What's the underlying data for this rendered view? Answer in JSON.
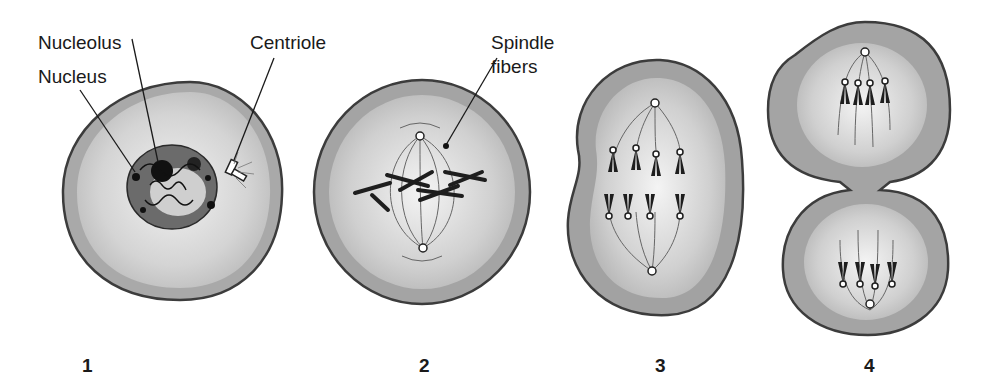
{
  "labels": {
    "nucleolus": "Nucleolus",
    "nucleus": "Nucleus",
    "centriole": "Centriole",
    "spindle_fibers_line1": "Spindle",
    "spindle_fibers_line2": "fibers"
  },
  "stages": [
    {
      "number": "1"
    },
    {
      "number": "2"
    },
    {
      "number": "3"
    },
    {
      "number": "4"
    }
  ],
  "colors": {
    "membrane": "#4a4a4a",
    "cytoplasm_outer": "#a8a8a8",
    "cytoplasm_mid": "#c8c8c8",
    "cytoplasm_inner": "#e6e6e6",
    "nucleus": "#6e6e6e",
    "chromosome": "#1e1e1e"
  }
}
